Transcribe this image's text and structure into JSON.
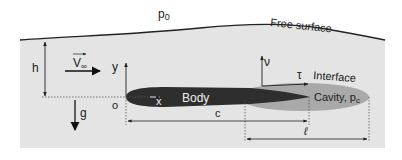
{
  "labels": {
    "ambient_pressure": "p",
    "ambient_pressure_sub": "0",
    "free_surface": "Free surface",
    "depth": "h",
    "velocity": "V",
    "velocity_sub": "∞",
    "y_axis": "y",
    "x_axis": "x",
    "origin": "o",
    "gravity": "g",
    "body": "Body",
    "normal": "ν",
    "tangent": "τ",
    "interface": "Interface",
    "cavity": "Cavity, p",
    "cavity_sub": "c",
    "chord": "c",
    "cavity_length": "ℓ"
  },
  "colors": {
    "water": "#e4e4e4",
    "body": "#2e2e2e",
    "cavity": "#a9a9a9",
    "line": "#222222"
  }
}
